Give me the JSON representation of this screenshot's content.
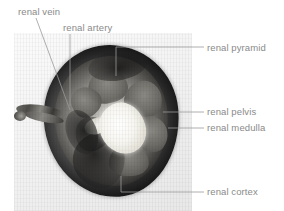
{
  "figure": {
    "image_caption": "Photograph of a sectioned kidney (coronal/transverse cut) on a pale background",
    "text_color": "#8a8a8a",
    "line_color": "#9a9a9a",
    "background_color": "#ffffff"
  },
  "labels": [
    {
      "id": "renal-vein",
      "text": "renal vein"
    },
    {
      "id": "renal-artery",
      "text": "renal artery"
    },
    {
      "id": "renal-pyramid",
      "text": "renal pyramid"
    },
    {
      "id": "renal-pelvis",
      "text": "renal pelvis"
    },
    {
      "id": "renal-medulla",
      "text": "renal medulla"
    },
    {
      "id": "renal-cortex",
      "text": "renal cortex"
    }
  ],
  "specimen": {
    "name": "kidney",
    "view": "cut surface",
    "structures": [
      "renal cortex",
      "renal medulla",
      "renal pyramid",
      "renal pelvis",
      "renal artery",
      "renal vein"
    ]
  }
}
